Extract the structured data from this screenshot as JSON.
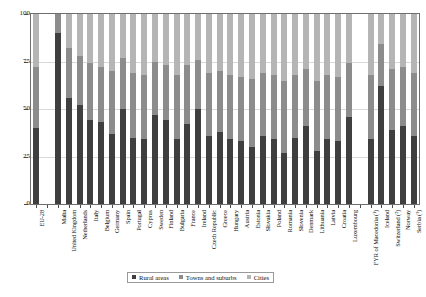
{
  "chart_data": {
    "type": "bar",
    "subtype": "stacked-percentage",
    "title": "",
    "xlabel": "",
    "ylabel": "",
    "ylim": [
      0,
      100
    ],
    "yticks": [
      0,
      25,
      50,
      75,
      100
    ],
    "ytick_labels": [
      "0",
      "25",
      "50",
      "75",
      "100"
    ],
    "grid": true,
    "legend_position": "bottom-center",
    "categories": [
      "EU-28",
      "",
      "Malta",
      "United Kingdom",
      "Netherlands",
      "Italy",
      "Belgium",
      "Germany",
      "Spain",
      "Portugal",
      "Cyprus",
      "Sweden",
      "Finland",
      "Bulgaria",
      "France",
      "Ireland",
      "Czech Republic",
      "Greece",
      "Hungary",
      "Austria",
      "Estonia",
      "Slovakia",
      "Poland",
      "Romania",
      "Slovenia",
      "Denmark",
      "Lithuania",
      "Latvia",
      "Croatia",
      "Luxembourg",
      "",
      "FYR of Macedonia (¹)",
      "Iceland",
      "Switzerland (²)",
      "Norway",
      "Serbia (³)"
    ],
    "series": [
      {
        "name": "Rural areas",
        "color": "#3f3f3f",
        "values": [
          40,
          null,
          90,
          56,
          52,
          44,
          43,
          37,
          50,
          35,
          34,
          47,
          44,
          34,
          42,
          50,
          36,
          38,
          34,
          33,
          30,
          36,
          34,
          27,
          35,
          41,
          28,
          34,
          33,
          46,
          null,
          34,
          62,
          39,
          41,
          36
        ]
      },
      {
        "name": "Towns and suburbs",
        "color": "#8c8c8c",
        "values": [
          32,
          null,
          10,
          26,
          26,
          30,
          29,
          33,
          27,
          34,
          34,
          28,
          29,
          34,
          31,
          26,
          33,
          32,
          34,
          34,
          36,
          33,
          34,
          38,
          33,
          30,
          37,
          34,
          34,
          28,
          null,
          34,
          22,
          32,
          31,
          33
        ]
      },
      {
        "name": "Cities",
        "color": "#b5b5b5",
        "values": [
          28,
          null,
          0,
          18,
          22,
          26,
          28,
          30,
          23,
          31,
          32,
          25,
          27,
          32,
          27,
          24,
          31,
          30,
          32,
          33,
          34,
          31,
          32,
          35,
          32,
          29,
          35,
          32,
          33,
          26,
          null,
          32,
          16,
          29,
          28,
          31
        ]
      }
    ]
  },
  "legend": {
    "items": [
      {
        "label": "Rural areas",
        "color": "#3f3f3f"
      },
      {
        "label": "Towns and suburbs",
        "color": "#8c8c8c"
      },
      {
        "label": "Cities",
        "color": "#b5b5b5"
      }
    ]
  },
  "axis": {
    "y_tick_labels": [
      "100",
      "75",
      "50",
      "25",
      "0"
    ]
  }
}
